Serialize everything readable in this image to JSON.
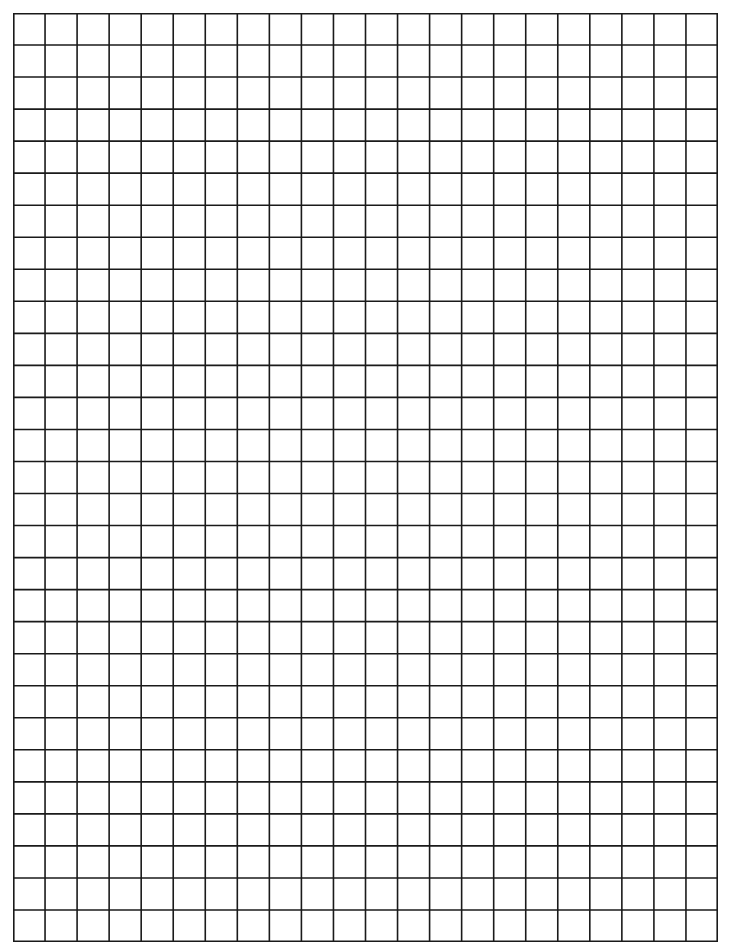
{
  "page": {
    "type": "graph-paper",
    "background_color": "#ffffff",
    "line_color": "#1a1a1a"
  },
  "grid": {
    "columns": 22,
    "rows": 29,
    "left": 13,
    "top": 13,
    "width": 705,
    "height": 929,
    "line_width": 1.6
  }
}
